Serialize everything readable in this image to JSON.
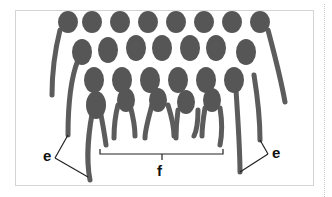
{
  "figure": {
    "cord_color": "#5a5a5a",
    "knot_color": "#555555",
    "line_color": "#222222",
    "labels": [
      {
        "id": "e-left",
        "text": "e",
        "x": 43,
        "y": 148
      },
      {
        "id": "f",
        "text": "f",
        "x": 157,
        "y": 169
      },
      {
        "id": "e-right",
        "text": "e",
        "x": 272,
        "y": 148
      }
    ]
  }
}
